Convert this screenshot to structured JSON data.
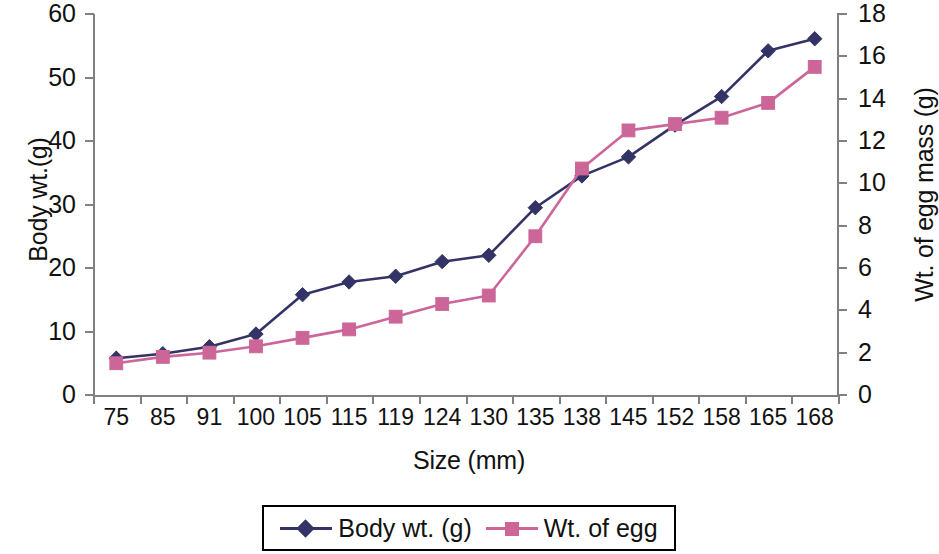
{
  "chart_data": {
    "type": "line",
    "title": "",
    "xlabel": "Size (mm)",
    "ylabel": "Body wt.(g)",
    "y2label": "Wt. of egg mass (g)",
    "categories": [
      "75",
      "85",
      "91",
      "100",
      "105",
      "115",
      "119",
      "124",
      "130",
      "135",
      "138",
      "145",
      "152",
      "158",
      "165",
      "168"
    ],
    "ylim": [
      0,
      60
    ],
    "y2lim": [
      0,
      18
    ],
    "yticks": [
      "60",
      "50",
      "40",
      "30",
      "20",
      "10",
      "0"
    ],
    "y2ticks": [
      "18",
      "16",
      "14",
      "12",
      "10",
      "8",
      "6",
      "4",
      "2",
      "0"
    ],
    "grid": false,
    "legend_position": "bottom",
    "series": [
      {
        "name": "Body wt. (g)",
        "axis": "left",
        "color": "#333366",
        "marker": "diamond",
        "values": [
          5.8,
          6.5,
          7.6,
          9.6,
          15.8,
          17.8,
          18.7,
          21.0,
          22.0,
          29.5,
          34.5,
          37.5,
          42.5,
          47.0,
          54.2,
          56.1
        ]
      },
      {
        "name": "Wt. of egg",
        "axis": "right",
        "color": "#CC6699",
        "marker": "square",
        "values": [
          1.5,
          1.8,
          2.0,
          2.3,
          2.7,
          3.1,
          3.7,
          4.3,
          4.7,
          7.5,
          10.7,
          12.5,
          12.8,
          13.1,
          13.8,
          15.5
        ]
      }
    ]
  },
  "legend": {
    "items": [
      {
        "label": "Body wt. (g)",
        "color": "#333366",
        "marker": "diamond"
      },
      {
        "label": "Wt. of egg",
        "color": "#CC6699",
        "marker": "square"
      }
    ]
  }
}
